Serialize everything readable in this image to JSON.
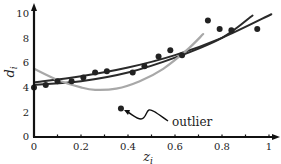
{
  "chart_data": {
    "type": "scatter",
    "title": "",
    "xlabel": "z_i",
    "ylabel": "d_i",
    "xlim": [
      0,
      1.0
    ],
    "ylim": [
      0,
      10
    ],
    "x_ticks": [
      0,
      0.1,
      0.2,
      0.3,
      0.4,
      0.5,
      0.6,
      0.7,
      0.8,
      0.9,
      1.0
    ],
    "x_tick_labels": [
      "0",
      "0.2",
      "0.4",
      "0.6",
      "0.8",
      "1"
    ],
    "y_tick_labels": [
      "0",
      "2",
      "4",
      "6",
      "8",
      "10"
    ],
    "grid": false,
    "legend": null,
    "series": [
      {
        "name": "data points",
        "kind": "scatter",
        "color": "#222222",
        "x": [
          0.0,
          0.05,
          0.1,
          0.16,
          0.21,
          0.26,
          0.31,
          0.42,
          0.47,
          0.53,
          0.58,
          0.63,
          0.74,
          0.79,
          0.84,
          0.95
        ],
        "y": [
          4.0,
          4.2,
          4.5,
          4.5,
          4.8,
          5.2,
          5.3,
          5.2,
          5.7,
          6.5,
          7.0,
          6.6,
          9.4,
          8.7,
          8.6,
          8.7
        ]
      },
      {
        "name": "outlier",
        "kind": "scatter",
        "color": "#222222",
        "x": [
          0.37
        ],
        "y": [
          2.3
        ]
      },
      {
        "name": "fit line A (dark, steeper)",
        "kind": "line",
        "color": "#2a2a2a",
        "x": [
          0.0,
          0.2,
          0.4,
          0.6,
          0.8,
          0.93
        ],
        "y": [
          4.2,
          4.5,
          5.2,
          6.4,
          8.0,
          9.8
        ]
      },
      {
        "name": "fit line B (dark, robust)",
        "kind": "line",
        "color": "#2a2a2a",
        "x": [
          0.0,
          0.2,
          0.4,
          0.6,
          0.8,
          1.01
        ],
        "y": [
          4.4,
          4.9,
          5.6,
          6.6,
          8.0,
          9.9
        ]
      },
      {
        "name": "fit curve C (gray, outlier-influenced)",
        "kind": "line",
        "color": "#a8a8a8",
        "x": [
          0.0,
          0.1,
          0.2,
          0.26,
          0.35,
          0.45,
          0.55,
          0.65,
          0.72
        ],
        "y": [
          5.5,
          4.6,
          4.0,
          3.8,
          3.9,
          4.5,
          5.5,
          7.0,
          8.3
        ]
      }
    ],
    "annotations": [
      {
        "text": "outlier",
        "target": [
          0.37,
          2.3
        ]
      }
    ]
  },
  "labels": {
    "x_axis": "z",
    "x_sub": "i",
    "y_axis": "d",
    "y_sub": "i",
    "annotation": "outlier",
    "x_ticks": [
      "0",
      "0.2",
      "0.4",
      "0.6",
      "0.8",
      "1"
    ],
    "y_ticks": [
      "0",
      "2",
      "4",
      "6",
      "8",
      "10"
    ]
  }
}
